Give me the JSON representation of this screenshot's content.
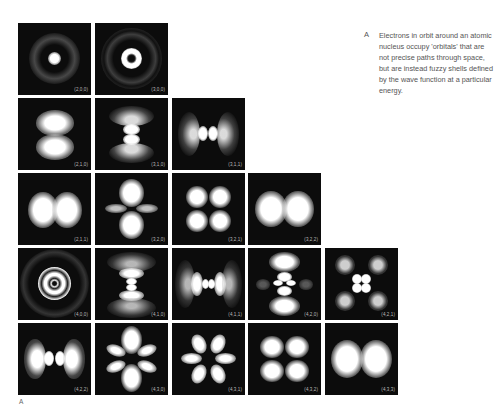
{
  "figure": {
    "label": "A",
    "caption_letter": "A",
    "caption": "Electrons in orbit around an atomic nucleus occupy 'orbitals' that are not precise paths through space, but are instead fuzzy shells defined by the wave function at a particular energy."
  },
  "panels": [
    {
      "id": "p200",
      "label": "(2,0,0)",
      "row": 0,
      "col": 0
    },
    {
      "id": "p300",
      "label": "(3,0,0)",
      "row": 0,
      "col": 1
    },
    {
      "id": "p210",
      "label": "(2,1,0)",
      "row": 1,
      "col": 0
    },
    {
      "id": "p310",
      "label": "(3,1,0)",
      "row": 1,
      "col": 1
    },
    {
      "id": "p311",
      "label": "(3,1,1)",
      "row": 1,
      "col": 2
    },
    {
      "id": "p211",
      "label": "(2,1,1)",
      "row": 2,
      "col": 0
    },
    {
      "id": "p320",
      "label": "(3,2,0)",
      "row": 2,
      "col": 1
    },
    {
      "id": "p321",
      "label": "(3,2,1)",
      "row": 2,
      "col": 2
    },
    {
      "id": "p322",
      "label": "(3,2,2)",
      "row": 2,
      "col": 3
    },
    {
      "id": "p400",
      "label": "(4,0,0)",
      "row": 3,
      "col": 0
    },
    {
      "id": "p410",
      "label": "(4,1,0)",
      "row": 3,
      "col": 1
    },
    {
      "id": "p411",
      "label": "(4,1,1)",
      "row": 3,
      "col": 2
    },
    {
      "id": "p420",
      "label": "(4,2,0)",
      "row": 3,
      "col": 3
    },
    {
      "id": "p421",
      "label": "(4,2,1)",
      "row": 3,
      "col": 4
    },
    {
      "id": "p422",
      "label": "(4,2,2)",
      "row": 4,
      "col": 0
    },
    {
      "id": "p430",
      "label": "(4,3,0)",
      "row": 4,
      "col": 1
    },
    {
      "id": "p431",
      "label": "(4,3,1)",
      "row": 4,
      "col": 2
    },
    {
      "id": "p432",
      "label": "(4,3,2)",
      "row": 4,
      "col": 3
    },
    {
      "id": "p433",
      "label": "(4,3,3)",
      "row": 4,
      "col": 4
    }
  ],
  "colors": {
    "panel_bg": "#0c0c0c",
    "glow": "#ffffff",
    "text": "#555555"
  }
}
